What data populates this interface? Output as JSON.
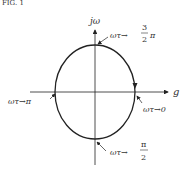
{
  "figure": {
    "caption_fragment": "FIG. 1",
    "axes": {
      "vertical_label": "jω",
      "horizontal_label": "g"
    },
    "annotations": [
      {
        "id": "top",
        "prefix": "ωτ→",
        "frac_num": "3",
        "frac_den": "2",
        "suffix": "π"
      },
      {
        "id": "left",
        "text": "ωτ→π"
      },
      {
        "id": "right",
        "text": "ωτ→0"
      },
      {
        "id": "bottom",
        "prefix": "ωτ→",
        "frac_num": "π",
        "frac_den": "2"
      }
    ],
    "colors": {
      "stroke": "#222222",
      "text": "#333333"
    }
  }
}
